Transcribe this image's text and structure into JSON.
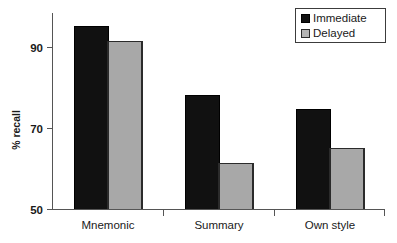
{
  "chart_data": {
    "type": "bar",
    "title": "",
    "xlabel": "",
    "ylabel": "% recall",
    "categories": [
      "Mnemonic",
      "Summary",
      "Own style"
    ],
    "series": [
      {
        "name": "Immediate",
        "color": "#111111",
        "values": [
          95.2,
          78.1,
          74.7
        ]
      },
      {
        "name": "Delayed",
        "color": "#a8a8a8",
        "values": [
          91.5,
          61.4,
          65.1
        ]
      }
    ],
    "ylim": [
      50,
      100
    ],
    "yticks": [
      50,
      70,
      90
    ],
    "ytick_labels": [
      "50",
      "70",
      "90"
    ],
    "grid": false,
    "legend_position": "top-right",
    "legend_entries": [
      "Immediate",
      "Delayed"
    ]
  },
  "axes": {
    "y_label": "% recall",
    "y_ticks": [
      "90",
      "70",
      "50"
    ]
  },
  "categories": {
    "items": [
      "Mnemonic",
      "Summary",
      "Own style"
    ]
  },
  "legend": {
    "items": [
      {
        "label": "Immediate"
      },
      {
        "label": "Delayed"
      }
    ]
  }
}
